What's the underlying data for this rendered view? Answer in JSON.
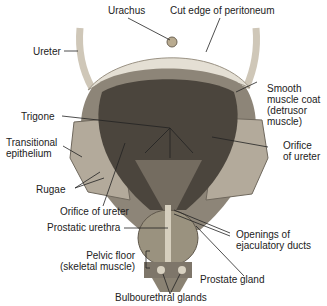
{
  "diagram": {
    "labels": {
      "urachus": "Urachus",
      "cut_edge": "Cut edge of peritoneum",
      "ureter": "Ureter",
      "smooth_muscle": "Smooth\nmuscle coat\n(detrusor\nmuscle)",
      "trigone": "Trigone",
      "transitional": "Transitional\nepithelium",
      "orifice_right": "Orifice\nof ureter",
      "rugae": "Rugae",
      "orifice_left": "Orifice of ureter",
      "prostatic_urethra": "Prostatic urethra",
      "openings": "Openings of\nejaculatory ducts",
      "pelvic_floor": "Pelvic floor\n(skeletal muscle)",
      "prostate": "Prostate gland",
      "bulbourethral": "Bulbourethral glands"
    }
  }
}
